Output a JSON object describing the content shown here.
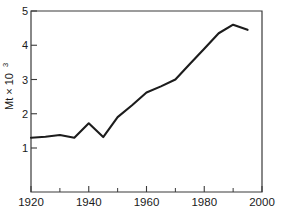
{
  "chart_data": {
    "type": "line",
    "title": "",
    "subtitle": "",
    "xlabel": "",
    "ylabel": "Mt × 10",
    "ylabel_exponent": "3",
    "xlim": [
      1920,
      2000
    ],
    "ylim": [
      0,
      5
    ],
    "grid": false,
    "legend": "none",
    "x_ticks_major": [
      1920,
      1940,
      1960,
      1980,
      2000
    ],
    "x_tick_labels": [
      "1920",
      "1940",
      "1960",
      "1980",
      "2000"
    ],
    "x_ticks_minor": [
      1930,
      1950,
      1970,
      1990
    ],
    "y_ticks_major": [
      1,
      2,
      3,
      4,
      5
    ],
    "y_tick_labels": [
      "1",
      "2",
      "3",
      "4",
      "5"
    ],
    "series": [
      {
        "name": "production",
        "color": "#1c1c1c",
        "x": [
          1920,
          1925,
          1930,
          1935,
          1940,
          1945,
          1950,
          1955,
          1960,
          1965,
          1970,
          1975,
          1980,
          1985,
          1990,
          1995
        ],
        "values": [
          1.3,
          1.33,
          1.38,
          1.3,
          1.72,
          1.32,
          1.9,
          2.25,
          2.62,
          2.8,
          3.0,
          3.45,
          3.9,
          4.35,
          4.6,
          4.45
        ]
      }
    ]
  },
  "axis": {
    "y_title_text": "Mt × 10",
    "y_title_exponent": "3"
  }
}
